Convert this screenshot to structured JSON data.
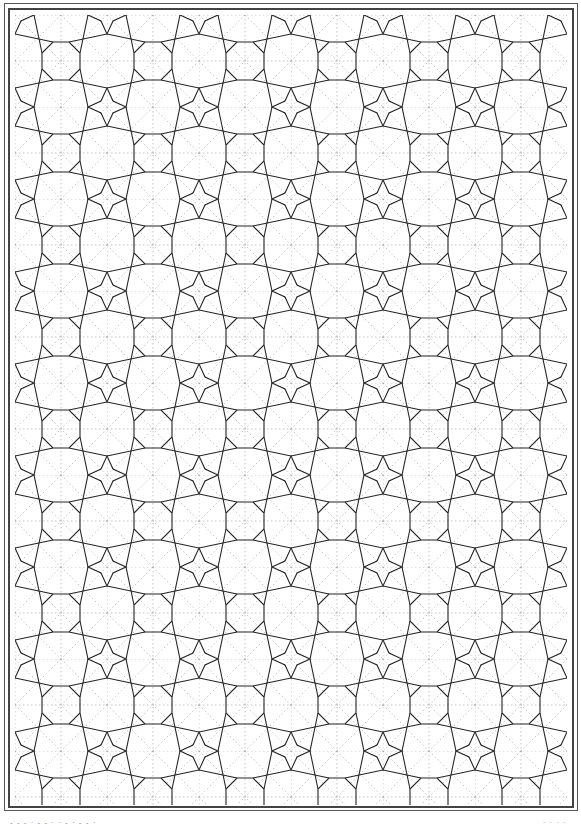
{
  "page": {
    "line_color": "#222222",
    "construction_line_color": "#9a9a9a",
    "background": "#ffffff"
  },
  "footer": {
    "left_text": "- - - · - - · · - · - - ·",
    "right_text": "· · · ·"
  }
}
